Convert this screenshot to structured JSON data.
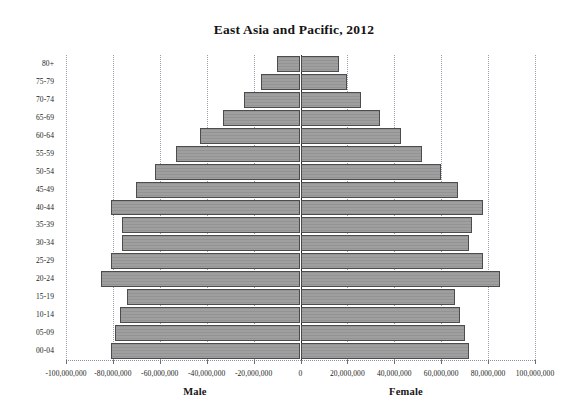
{
  "chart_data": {
    "type": "bar",
    "subtype": "population-pyramid",
    "title": "East Asia and Pacific, 2012",
    "xlabel": "",
    "ylabel": "",
    "xlim": [
      -100000000,
      100000000
    ],
    "xtick_step": 20000000,
    "grid": true,
    "legend": "none",
    "orientation": "horizontal",
    "bar_color": "#9a9a9a",
    "bar_border_color": "#4c4c4c",
    "categories": [
      "00-04",
      "05-09",
      "10-14",
      "15-19",
      "20-24",
      "25-29",
      "30-34",
      "35-39",
      "40-44",
      "45-49",
      "50-54",
      "55-59",
      "60-64",
      "65-69",
      "70-74",
      "75-79",
      "80+"
    ],
    "x_tick_labels": [
      "-100,000,000",
      "-80,000,000",
      "-60,000,000",
      "-40,000,000",
      "-20,000,000",
      "0",
      "20,000,000",
      "40,000,000",
      "60,000,000",
      "80,000,000",
      "100,000,000"
    ],
    "x_tick_values": [
      -100000000,
      -80000000,
      -60000000,
      -40000000,
      -20000000,
      0,
      20000000,
      40000000,
      60000000,
      80000000,
      100000000
    ],
    "series": [
      {
        "name": "Male",
        "side": "left",
        "axis_label": "Male",
        "values": [
          81000000,
          79000000,
          77000000,
          74000000,
          85000000,
          81000000,
          76000000,
          76000000,
          81000000,
          70000000,
          62000000,
          53000000,
          43000000,
          33000000,
          24000000,
          17000000,
          10000000
        ]
      },
      {
        "name": "Female",
        "side": "right",
        "axis_label": "Female",
        "values": [
          72000000,
          70000000,
          68000000,
          66000000,
          85000000,
          78000000,
          72000000,
          73000000,
          78000000,
          67000000,
          60000000,
          52000000,
          43000000,
          34000000,
          26000000,
          20000000,
          16500000
        ]
      }
    ]
  },
  "axis": {
    "male_label": "Male",
    "female_label": "Female"
  }
}
